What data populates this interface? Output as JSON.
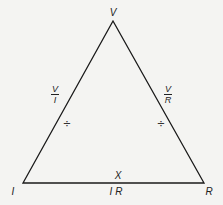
{
  "diagram": {
    "type": "ohms-law-triangle",
    "vertices": {
      "top": {
        "label": "V",
        "x": 113,
        "y": 21
      },
      "left": {
        "label": "I",
        "x": 23,
        "y": 183
      },
      "right": {
        "label": "R",
        "x": 204,
        "y": 183
      }
    },
    "vertex_labels": {
      "top": "V",
      "left": "I",
      "right": "R"
    },
    "edges": {
      "left": {
        "numerator": "V",
        "denominator": "I",
        "operator": "÷"
      },
      "right": {
        "numerator": "V",
        "denominator": "R",
        "operator": "÷"
      },
      "bottom": {
        "operator": "X",
        "expression": "I R"
      }
    },
    "colors": {
      "line": "#1a1a1a",
      "background": "#f4f4f2"
    }
  }
}
